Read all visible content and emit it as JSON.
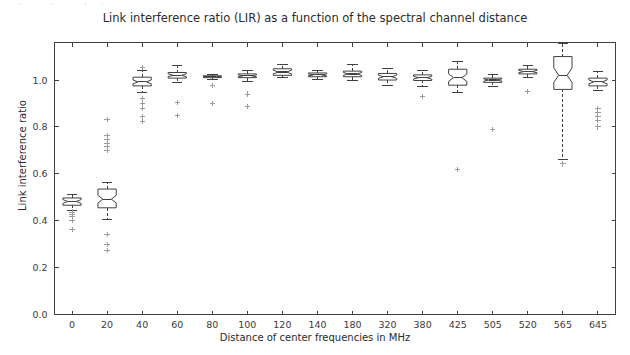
{
  "figure": {
    "top_fragment": "· · ··",
    "background_color": "#ffffff",
    "line_color": "#404040",
    "outlier_color": "#9c9c9c"
  },
  "chart_data": {
    "type": "box",
    "title": "Link interference ratio (LIR) as a function of the spectral channel distance",
    "xlabel": "Distance of center frequencies in MHz",
    "ylabel": "Link interference ratio",
    "categories": [
      "0",
      "20",
      "40",
      "60",
      "80",
      "100",
      "120",
      "140",
      "180",
      "320",
      "380",
      "425",
      "505",
      "520",
      "565",
      "645"
    ],
    "ylim": [
      0.0,
      1.16
    ],
    "yticks": [
      0.0,
      0.2,
      0.4,
      0.6,
      0.8,
      1.0
    ],
    "yticklabels": [
      "0.0",
      "0.2",
      "0.4",
      "0.6",
      "0.8",
      "1.0"
    ],
    "grid": false,
    "notched": true,
    "boxes": [
      {
        "category": "0",
        "whislo": 0.443,
        "q1": 0.466,
        "med": 0.482,
        "q3": 0.497,
        "whishi": 0.512,
        "cilo": 0.474,
        "cihi": 0.49,
        "fliers": [
          0.437,
          0.428,
          0.418,
          0.4,
          0.362
        ]
      },
      {
        "category": "20",
        "whislo": 0.406,
        "q1": 0.455,
        "med": 0.492,
        "q3": 0.535,
        "whishi": 0.565,
        "cilo": 0.476,
        "cihi": 0.508,
        "fliers": [
          0.83,
          0.762,
          0.745,
          0.73,
          0.715,
          0.7,
          0.34,
          0.3,
          0.272
        ]
      },
      {
        "category": "40",
        "whislo": 0.945,
        "q1": 0.975,
        "med": 0.992,
        "q3": 1.012,
        "whishi": 1.042,
        "cilo": 0.984,
        "cihi": 1.0,
        "fliers": [
          1.055,
          0.92,
          0.9,
          0.88,
          0.845,
          0.822
        ]
      },
      {
        "category": "60",
        "whislo": 0.988,
        "q1": 1.008,
        "med": 1.02,
        "q3": 1.032,
        "whishi": 1.06,
        "cilo": 1.014,
        "cihi": 1.026,
        "fliers": [
          0.905,
          0.848
        ]
      },
      {
        "category": "80",
        "whislo": 1.004,
        "q1": 1.01,
        "med": 1.014,
        "q3": 1.018,
        "whishi": 1.024,
        "cilo": 1.012,
        "cihi": 1.016,
        "fliers": [
          0.975,
          0.9
        ]
      },
      {
        "category": "100",
        "whislo": 0.995,
        "q1": 1.01,
        "med": 1.018,
        "q3": 1.026,
        "whishi": 1.04,
        "cilo": 1.014,
        "cihi": 1.022,
        "fliers": [
          0.94,
          0.888
        ]
      },
      {
        "category": "120",
        "whislo": 1.012,
        "q1": 1.02,
        "med": 1.034,
        "q3": 1.048,
        "whishi": 1.068,
        "cilo": 1.026,
        "cihi": 1.042,
        "fliers": []
      },
      {
        "category": "140",
        "whislo": 1.004,
        "q1": 1.014,
        "med": 1.022,
        "q3": 1.03,
        "whishi": 1.042,
        "cilo": 1.018,
        "cihi": 1.026,
        "fliers": []
      },
      {
        "category": "180",
        "whislo": 0.998,
        "q1": 1.014,
        "med": 1.026,
        "q3": 1.038,
        "whishi": 1.068,
        "cilo": 1.02,
        "cihi": 1.032,
        "fliers": []
      },
      {
        "category": "320",
        "whislo": 0.978,
        "q1": 1.0,
        "med": 1.014,
        "q3": 1.028,
        "whishi": 1.05,
        "cilo": 1.007,
        "cihi": 1.021,
        "fliers": []
      },
      {
        "category": "380",
        "whislo": 0.972,
        "q1": 0.998,
        "med": 1.01,
        "q3": 1.022,
        "whishi": 1.042,
        "cilo": 1.004,
        "cihi": 1.016,
        "fliers": [
          0.93
        ]
      },
      {
        "category": "425",
        "whislo": 0.945,
        "q1": 0.978,
        "med": 1.01,
        "q3": 1.046,
        "whishi": 1.08,
        "cilo": 0.994,
        "cihi": 1.026,
        "fliers": [
          0.62
        ]
      },
      {
        "category": "505",
        "whislo": 0.972,
        "q1": 0.99,
        "med": 1.0,
        "q3": 1.008,
        "whishi": 1.022,
        "cilo": 0.995,
        "cihi": 1.005,
        "fliers": [
          0.79
        ]
      },
      {
        "category": "520",
        "whislo": 1.012,
        "q1": 1.026,
        "med": 1.036,
        "q3": 1.046,
        "whishi": 1.06,
        "cilo": 1.031,
        "cihi": 1.041,
        "fliers": [
          0.952
        ]
      },
      {
        "category": "565",
        "whislo": 0.66,
        "q1": 0.96,
        "med": 1.02,
        "q3": 1.1,
        "whishi": 1.155,
        "cilo": 0.99,
        "cihi": 1.052,
        "fliers": [
          0.642
        ]
      },
      {
        "category": "645",
        "whislo": 0.955,
        "q1": 0.975,
        "med": 0.992,
        "q3": 1.008,
        "whishi": 1.035,
        "cilo": 0.984,
        "cihi": 1.0,
        "fliers": [
          0.88,
          0.862,
          0.845,
          0.828,
          0.8
        ]
      }
    ]
  }
}
